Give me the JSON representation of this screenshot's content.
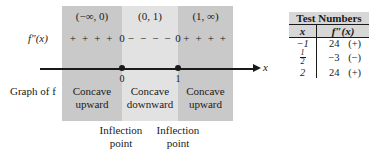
{
  "diagram": {
    "row_labels": {
      "second_derivative": "f″(x)",
      "graph_of_f": "Graph of f"
    },
    "axis": {
      "variable": "x",
      "tick_labels": [
        "0",
        "1"
      ]
    },
    "intervals": [
      {
        "notation": "(−∞, 0)",
        "signs": "+ + + +",
        "concavity_line1": "Concave",
        "concavity_line2": "upward"
      },
      {
        "notation": "(0, 1)",
        "signs": "− − − −",
        "concavity_line1": "Concave",
        "concavity_line2": "downward"
      },
      {
        "notation": "(1, ∞)",
        "signs": "+ + + +",
        "concavity_line1": "Concave",
        "concavity_line2": "upward"
      }
    ],
    "zero_marks": [
      "0",
      "0"
    ],
    "inflection_callouts": [
      {
        "line1": "Inflection",
        "line2": "point"
      },
      {
        "line1": "Inflection",
        "line2": "point"
      }
    ],
    "colors": {
      "band_outer": "#c9c9c9",
      "band_inner": "#e2e2e2",
      "table_header": "#d7d7d7",
      "ink": "#1a1a1a"
    }
  },
  "test_table": {
    "title": "Test Numbers",
    "columns": [
      "x",
      "f″(x)"
    ],
    "rows": [
      {
        "x": "−1",
        "x_is_fraction": false,
        "value": "24",
        "sign": "(+)"
      },
      {
        "x": "1/2",
        "x_is_fraction": true,
        "x_num": "1",
        "x_den": "2",
        "value": "−3",
        "sign": "(−)"
      },
      {
        "x": "2",
        "x_is_fraction": false,
        "value": "24",
        "sign": "(+)"
      }
    ]
  }
}
